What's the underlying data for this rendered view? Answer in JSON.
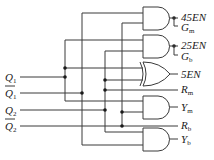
{
  "diagram": {
    "type": "logic-circuit",
    "inputs": [
      {
        "id": "q1",
        "base": "Q",
        "sub": "1",
        "overline": false
      },
      {
        "id": "q1n",
        "base": "Q",
        "sub": "1",
        "overline": true
      },
      {
        "id": "q2",
        "base": "Q",
        "sub": "2",
        "overline": false
      },
      {
        "id": "q2n",
        "base": "Q",
        "sub": "2",
        "overline": true
      }
    ],
    "gates": [
      {
        "id": "and1",
        "type": "AND",
        "inputs": [
          "Q̄1",
          "Q̄2"
        ],
        "outputs": [
          "45EN",
          "Gm"
        ]
      },
      {
        "id": "and2",
        "type": "AND",
        "inputs": [
          "Q1",
          "Q2"
        ],
        "outputs": [
          "25EN",
          "Gb"
        ]
      },
      {
        "id": "xor1",
        "type": "XOR",
        "inputs": [
          "Q1",
          "Q2"
        ],
        "outputs": [
          "5EN"
        ]
      },
      {
        "id": "and3",
        "type": "AND",
        "inputs": [
          "Q1",
          "Q̄2"
        ],
        "outputs": [
          "Ym"
        ]
      },
      {
        "id": "and4",
        "type": "AND",
        "inputs": [
          "Q2",
          "Q̄1"
        ],
        "outputs": [
          "Yb"
        ]
      }
    ],
    "outputs": [
      {
        "id": "en45",
        "text": "45EN"
      },
      {
        "id": "gm",
        "base": "G",
        "sub": "m"
      },
      {
        "id": "en25",
        "text": "25EN"
      },
      {
        "id": "gb",
        "base": "G",
        "sub": "b"
      },
      {
        "id": "en5",
        "text": "5EN"
      },
      {
        "id": "rm",
        "base": "R",
        "sub": "m"
      },
      {
        "id": "ym",
        "base": "Y",
        "sub": "m"
      },
      {
        "id": "rb",
        "base": "R",
        "sub": "b"
      },
      {
        "id": "yb",
        "base": "Y",
        "sub": "b"
      }
    ]
  }
}
